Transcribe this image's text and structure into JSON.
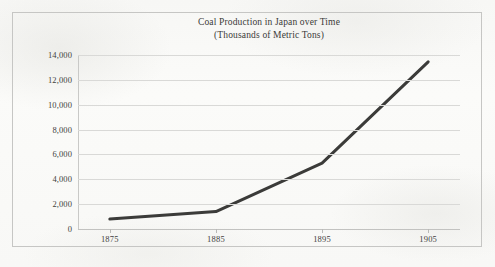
{
  "figure": {
    "title_line1": "Coal Production in Japan over Time",
    "title_line2": "(Thousands of Metric Tons)",
    "border_color": "#c6c6c4",
    "background_color": "#fbfbf9"
  },
  "chart_data": {
    "type": "line",
    "title": "Coal Production in Japan over Time (Thousands of Metric Tons)",
    "subtitle": "(Thousands of Metric Tons)",
    "xlabel": "",
    "ylabel": "",
    "x": [
      1875,
      1885,
      1895,
      1905
    ],
    "categories": [
      "1875",
      "1885",
      "1895",
      "1905"
    ],
    "values": [
      800,
      1400,
      5300,
      13450
    ],
    "series": [
      {
        "name": "Coal Production",
        "values": [
          800,
          1400,
          5300,
          13450
        ],
        "color": "#3b3b39",
        "line_width": 3
      }
    ],
    "xlim": [
      1872,
      1908
    ],
    "ylim": [
      0,
      14000
    ],
    "ytick_values": [
      0,
      2000,
      4000,
      6000,
      8000,
      10000,
      12000,
      14000
    ],
    "ytick_labels": [
      "0",
      "2,000",
      "4,000",
      "6,000",
      "8,000",
      "10,000",
      "12,000",
      "14,000"
    ],
    "xtick_values": [
      1875,
      1885,
      1895,
      1905
    ],
    "xtick_labels": [
      "1875",
      "1885",
      "1895",
      "1905"
    ],
    "grid": "horizontal",
    "grid_color": "#d9d9d7",
    "legend": "none",
    "markers": "none"
  }
}
